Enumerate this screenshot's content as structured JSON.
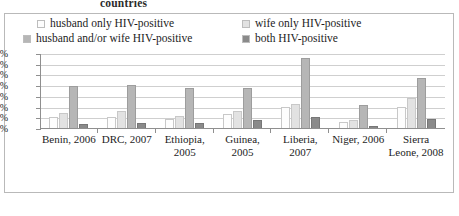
{
  "title": {
    "partial_text": "countries"
  },
  "legend": {
    "position": "top",
    "items": [
      {
        "label": "husband only HIV-positive",
        "color": "#fdfdfd",
        "key": "husband_only"
      },
      {
        "label": "wife only HIV-positive",
        "color": "#e2e2e2",
        "key": "wife_only"
      },
      {
        "label": "husband and/or wife HIV-positive",
        "color": "#b6b6b6",
        "key": "either"
      },
      {
        "label": "both HIV-positive",
        "color": "#8a8a8a",
        "key": "both"
      }
    ]
  },
  "yaxis": {
    "ticks": [
      "3.5%",
      "3.0%",
      "2.5%",
      "2.0%",
      "1.5%",
      "1.0%",
      "0.5%",
      "0.0%"
    ]
  },
  "chart_data": {
    "type": "bar",
    "title": "countries",
    "xlabel": "",
    "ylabel": "",
    "ylim": [
      0,
      3.5
    ],
    "ytick_values": [
      0.0,
      0.5,
      1.0,
      1.5,
      2.0,
      2.5,
      3.0,
      3.5
    ],
    "ytick_labels": [
      "0.0%",
      "0.5%",
      "1.0%",
      "1.5%",
      "2.0%",
      "2.5%",
      "3.0%",
      "3.5%"
    ],
    "grid": true,
    "legend_position": "top",
    "categories": [
      "Benin, 2006",
      "DRC, 2007",
      "Ethiopia, 2005",
      "Guinea, 2005",
      "Liberia, 2007",
      "Niger, 2006",
      "Sierra Leone, 2008"
    ],
    "series": [
      {
        "name": "husband only HIV-positive",
        "color": "#fdfdfd",
        "values": [
          0.55,
          0.55,
          0.45,
          0.7,
          1.05,
          0.35,
          1.05
        ]
      },
      {
        "name": "wife only HIV-positive",
        "color": "#e2e2e2",
        "values": [
          0.75,
          0.85,
          0.6,
          0.85,
          1.15,
          0.4,
          1.45
        ]
      },
      {
        "name": "husband and/or wife HIV-positive",
        "color": "#b6b6b6",
        "values": [
          2.0,
          2.05,
          1.9,
          1.9,
          3.3,
          1.1,
          2.4
        ]
      },
      {
        "name": "both HIV-positive",
        "color": "#8a8a8a",
        "values": [
          0.25,
          0.3,
          0.3,
          0.4,
          0.55,
          0.15,
          0.45
        ]
      }
    ]
  }
}
